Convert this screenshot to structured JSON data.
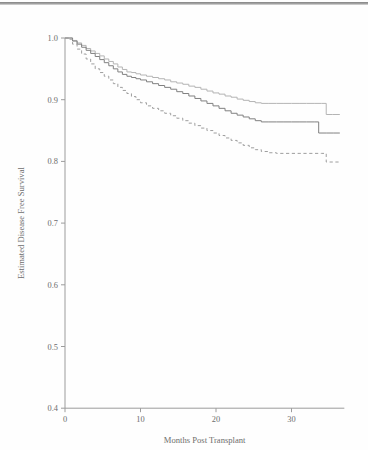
{
  "chart_data": {
    "type": "line",
    "title": "",
    "subtitle": "",
    "xlabel": "Months Post Transplant",
    "ylabel": "Estimated Disease Free Survival",
    "xlim": [
      0,
      37
    ],
    "ylim": [
      0.4,
      1.0
    ],
    "xticks": [
      0,
      10,
      20,
      30
    ],
    "xticklabels": [
      "0",
      "10",
      "20",
      "30"
    ],
    "yticks": [
      0.4,
      0.5,
      0.6,
      0.7,
      0.8,
      0.9,
      1.0
    ],
    "yticklabels": [
      "0.4",
      "0.5",
      "0.6",
      "0.7",
      "0.8",
      "0.9",
      "1.0"
    ],
    "grid": false,
    "legend": "none",
    "series": [
      {
        "name": "upper-curve",
        "style": "solid",
        "color": "#b4b4b4",
        "width": 1.0,
        "points": [
          [
            0.0,
            1.0
          ],
          [
            0.7,
            1.0
          ],
          [
            1.0,
            0.996
          ],
          [
            1.6,
            0.992
          ],
          [
            2.2,
            0.988
          ],
          [
            2.8,
            0.983
          ],
          [
            3.4,
            0.979
          ],
          [
            4.0,
            0.975
          ],
          [
            4.6,
            0.971
          ],
          [
            5.2,
            0.966
          ],
          [
            5.8,
            0.962
          ],
          [
            6.4,
            0.958
          ],
          [
            7.0,
            0.953
          ],
          [
            7.6,
            0.949
          ],
          [
            8.2,
            0.945
          ],
          [
            8.8,
            0.944
          ],
          [
            9.4,
            0.942
          ],
          [
            10.0,
            0.94
          ],
          [
            10.8,
            0.938
          ],
          [
            11.6,
            0.936
          ],
          [
            12.4,
            0.934
          ],
          [
            13.2,
            0.932
          ],
          [
            14.0,
            0.929
          ],
          [
            14.8,
            0.927
          ],
          [
            15.6,
            0.925
          ],
          [
            16.4,
            0.922
          ],
          [
            17.2,
            0.92
          ],
          [
            18.0,
            0.917
          ],
          [
            18.8,
            0.914
          ],
          [
            19.6,
            0.911
          ],
          [
            20.4,
            0.909
          ],
          [
            21.2,
            0.906
          ],
          [
            22.0,
            0.904
          ],
          [
            22.8,
            0.901
          ],
          [
            23.6,
            0.899
          ],
          [
            24.4,
            0.897
          ],
          [
            25.2,
            0.895
          ],
          [
            26.0,
            0.894
          ],
          [
            27.0,
            0.894
          ],
          [
            28.0,
            0.894
          ],
          [
            29.0,
            0.894
          ],
          [
            30.0,
            0.894
          ],
          [
            31.0,
            0.894
          ],
          [
            32.0,
            0.894
          ],
          [
            33.0,
            0.894
          ],
          [
            34.0,
            0.894
          ],
          [
            34.6,
            0.876
          ],
          [
            35.4,
            0.876
          ],
          [
            36.4,
            0.876
          ]
        ]
      },
      {
        "name": "middle-curve",
        "style": "solid",
        "color": "#808080",
        "width": 1.0,
        "points": [
          [
            0.0,
            1.0
          ],
          [
            0.6,
            1.0
          ],
          [
            1.0,
            0.995
          ],
          [
            1.6,
            0.99
          ],
          [
            2.2,
            0.985
          ],
          [
            2.8,
            0.98
          ],
          [
            3.4,
            0.975
          ],
          [
            4.0,
            0.97
          ],
          [
            4.6,
            0.965
          ],
          [
            5.2,
            0.96
          ],
          [
            5.8,
            0.955
          ],
          [
            6.4,
            0.95
          ],
          [
            7.0,
            0.945
          ],
          [
            7.6,
            0.941
          ],
          [
            8.2,
            0.938
          ],
          [
            8.8,
            0.936
          ],
          [
            9.4,
            0.934
          ],
          [
            10.0,
            0.932
          ],
          [
            10.8,
            0.929
          ],
          [
            11.6,
            0.926
          ],
          [
            12.4,
            0.923
          ],
          [
            13.2,
            0.92
          ],
          [
            14.0,
            0.917
          ],
          [
            14.8,
            0.913
          ],
          [
            15.6,
            0.91
          ],
          [
            16.4,
            0.906
          ],
          [
            17.2,
            0.902
          ],
          [
            18.0,
            0.898
          ],
          [
            18.8,
            0.894
          ],
          [
            19.6,
            0.89
          ],
          [
            20.4,
            0.886
          ],
          [
            21.2,
            0.882
          ],
          [
            22.0,
            0.878
          ],
          [
            22.8,
            0.875
          ],
          [
            23.6,
            0.872
          ],
          [
            24.4,
            0.869
          ],
          [
            25.2,
            0.866
          ],
          [
            26.0,
            0.864
          ],
          [
            27.0,
            0.864
          ],
          [
            28.0,
            0.864
          ],
          [
            29.0,
            0.864
          ],
          [
            30.0,
            0.864
          ],
          [
            31.0,
            0.864
          ],
          [
            32.0,
            0.864
          ],
          [
            33.0,
            0.864
          ],
          [
            33.6,
            0.846
          ],
          [
            34.6,
            0.846
          ],
          [
            35.6,
            0.846
          ],
          [
            36.4,
            0.846
          ]
        ]
      },
      {
        "name": "lower-curve",
        "style": "dashed",
        "color": "#9e9e9e",
        "width": 1.0,
        "points": [
          [
            0.0,
            1.0
          ],
          [
            0.5,
            0.998
          ],
          [
            1.0,
            0.99
          ],
          [
            1.6,
            0.982
          ],
          [
            2.2,
            0.974
          ],
          [
            2.8,
            0.966
          ],
          [
            3.4,
            0.958
          ],
          [
            4.0,
            0.95
          ],
          [
            4.6,
            0.944
          ],
          [
            5.2,
            0.938
          ],
          [
            5.8,
            0.932
          ],
          [
            6.4,
            0.926
          ],
          [
            7.0,
            0.92
          ],
          [
            7.6,
            0.915
          ],
          [
            8.2,
            0.91
          ],
          [
            8.8,
            0.905
          ],
          [
            9.4,
            0.9
          ],
          [
            10.0,
            0.895
          ],
          [
            10.8,
            0.89
          ],
          [
            11.6,
            0.886
          ],
          [
            12.4,
            0.882
          ],
          [
            13.2,
            0.878
          ],
          [
            14.0,
            0.874
          ],
          [
            14.8,
            0.87
          ],
          [
            15.6,
            0.866
          ],
          [
            16.4,
            0.862
          ],
          [
            17.2,
            0.858
          ],
          [
            18.0,
            0.854
          ],
          [
            18.8,
            0.85
          ],
          [
            19.6,
            0.846
          ],
          [
            20.4,
            0.842
          ],
          [
            21.2,
            0.838
          ],
          [
            22.0,
            0.834
          ],
          [
            22.8,
            0.83
          ],
          [
            23.6,
            0.826
          ],
          [
            24.4,
            0.822
          ],
          [
            25.2,
            0.819
          ],
          [
            26.0,
            0.816
          ],
          [
            27.0,
            0.814
          ],
          [
            28.0,
            0.813
          ],
          [
            29.0,
            0.813
          ],
          [
            30.0,
            0.813
          ],
          [
            31.0,
            0.813
          ],
          [
            32.0,
            0.813
          ],
          [
            33.0,
            0.813
          ],
          [
            34.0,
            0.813
          ],
          [
            34.6,
            0.799
          ],
          [
            35.6,
            0.799
          ],
          [
            36.4,
            0.799
          ]
        ]
      }
    ]
  }
}
